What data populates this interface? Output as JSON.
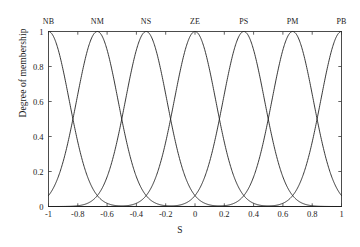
{
  "chart_data": {
    "type": "line",
    "title": "",
    "xlabel": "S",
    "ylabel": "Degree of membership",
    "xlim": [
      -1,
      1
    ],
    "ylim": [
      0,
      1
    ],
    "grid": false,
    "legend_position": "top-axis-labels",
    "xticks": [
      -1,
      -0.8,
      -0.6,
      -0.4,
      -0.2,
      0,
      0.2,
      0.4,
      0.6,
      0.8,
      1
    ],
    "xticklabels": [
      "-1",
      "-0.8",
      "-0.6",
      "-0.4",
      "-0.2",
      "0",
      "0.2",
      "0.4",
      "0.6",
      "0.8",
      "1"
    ],
    "yticks": [
      0,
      0.2,
      0.4,
      0.6,
      0.8,
      1
    ],
    "yticklabels": [
      "0",
      "0.2",
      "0.4",
      "0.6",
      "0.8",
      "1"
    ],
    "membership_function_shape": "gaussian",
    "sigma": 0.1415,
    "line_color": "#222222",
    "line_width": 0.9,
    "series": [
      {
        "name": "NB",
        "center": -1,
        "peak": 1,
        "values_at_xticks": [
          1.0,
          0.25,
          0.004,
          0.0,
          0.0,
          0.0,
          0.0,
          0.0,
          0.0,
          0.0,
          0.0
        ]
      },
      {
        "name": "NM",
        "center": -0.6667,
        "peak": 1,
        "values_at_xticks": [
          0.065,
          0.69,
          0.69,
          0.065,
          0.001,
          0.0,
          0.0,
          0.0,
          0.0,
          0.0,
          0.0
        ]
      },
      {
        "name": "NS",
        "center": -0.3333,
        "peak": 1,
        "values_at_xticks": [
          0.0,
          0.001,
          0.065,
          0.69,
          0.69,
          0.065,
          0.001,
          0.0,
          0.0,
          0.0,
          0.0
        ]
      },
      {
        "name": "ZE",
        "center": 0,
        "peak": 1,
        "values_at_xticks": [
          0.0,
          0.0,
          0.001,
          0.065,
          0.69,
          1.0,
          0.69,
          0.065,
          0.001,
          0.0,
          0.0
        ]
      },
      {
        "name": "PS",
        "center": 0.3333,
        "peak": 1,
        "values_at_xticks": [
          0.0,
          0.0,
          0.0,
          0.0,
          0.001,
          0.065,
          0.69,
          0.69,
          0.065,
          0.001,
          0.0
        ]
      },
      {
        "name": "PM",
        "center": 0.6667,
        "peak": 1,
        "values_at_xticks": [
          0.0,
          0.0,
          0.0,
          0.0,
          0.0,
          0.0,
          0.001,
          0.065,
          0.69,
          0.69,
          0.065
        ]
      },
      {
        "name": "PB",
        "center": 1,
        "peak": 1,
        "values_at_xticks": [
          0.0,
          0.0,
          0.0,
          0.0,
          0.0,
          0.0,
          0.0,
          0.0,
          0.004,
          0.25,
          1.0
        ]
      }
    ],
    "crossover_points": [
      {
        "x": -0.8333,
        "y": 0.5
      },
      {
        "x": -0.5,
        "y": 0.5
      },
      {
        "x": -0.1667,
        "y": 0.5
      },
      {
        "x": 0.1667,
        "y": 0.5
      },
      {
        "x": 0.5,
        "y": 0.5
      },
      {
        "x": 0.8333,
        "y": 0.5
      }
    ],
    "top_labels": [
      "NB",
      "NM",
      "NS",
      "ZE",
      "PS",
      "PM",
      "PB"
    ]
  }
}
